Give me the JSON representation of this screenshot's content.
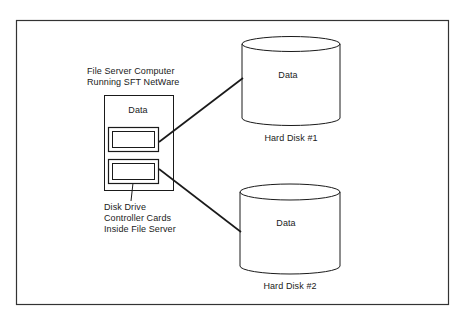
{
  "server": {
    "title_line1": "File Server Computer",
    "title_line2": "Running SFT NetWare",
    "data_label": "Data",
    "cards_label_line1": "Disk Drive",
    "cards_label_line2": "Controller Cards",
    "cards_label_line3": "Inside File Server"
  },
  "disks": [
    {
      "data_label": "Data",
      "name": "Hard Disk #1"
    },
    {
      "data_label": "Data",
      "name": "Hard Disk #2"
    }
  ],
  "colors": {
    "stroke": "#1a1a1a",
    "background": "#ffffff"
  }
}
